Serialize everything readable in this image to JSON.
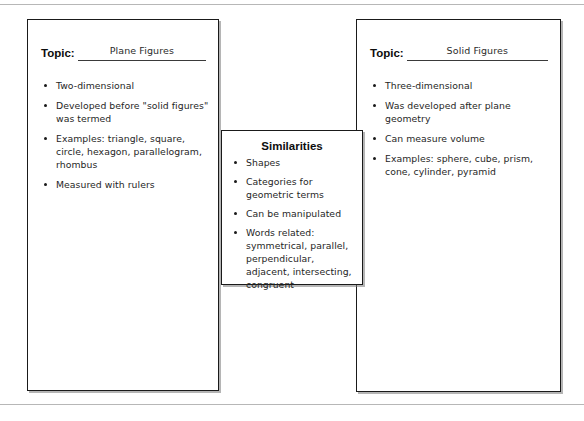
{
  "page": {
    "rules": [
      "top-page-rule",
      "bottom-page-rule"
    ],
    "ink_color": "#1a1a1a",
    "background_color": "#ffffff"
  },
  "left_box": {
    "topic_label": "Topic:",
    "topic_value": "Plane Figures",
    "bullets": [
      "Two-dimensional",
      "Developed before \"solid figures\" was termed",
      "Examples: triangle, square, circle, hexagon, parallelogram, rhombus",
      "Measured with rulers"
    ]
  },
  "middle_box": {
    "heading": "Similarities",
    "bullets": [
      "Shapes",
      "Categories for geometric terms",
      "Can be manipulated",
      "Words related: symmetrical, parallel, perpendicular, adjacent, intersecting, congruent"
    ]
  },
  "right_box": {
    "topic_label": "Topic:",
    "topic_value": "Solid Figures",
    "bullets": [
      "Three-dimensional",
      "Was developed after plane geometry",
      "Can measure volume",
      "Examples: sphere, cube, prism, cone, cylinder, pyramid"
    ]
  }
}
